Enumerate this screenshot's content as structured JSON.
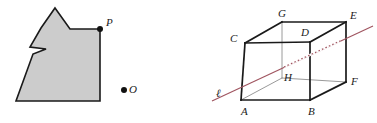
{
  "page": {
    "width": 377,
    "height": 123,
    "background": "#ffffff"
  },
  "colors": {
    "polygon_fill": "#cccccc",
    "polygon_stroke": "#1a1a1a",
    "cube_edge_visible": "#1a1a1a",
    "cube_edge_back": "#9a9a9a",
    "line_l": "#a05560",
    "point_fill": "#111111",
    "label": "#1a1a1a"
  },
  "figure_left": {
    "name": "shaded-polygon-with-points",
    "polygon": {
      "label": "shaded-polygon",
      "fill": "#cccccc",
      "stroke": "#1a1a1a",
      "stroke_width": 1.6,
      "vertices": [
        [
          55,
          8
        ],
        [
          70,
          29
        ],
        [
          100,
          29
        ],
        [
          100,
          101
        ],
        [
          16,
          101
        ],
        [
          33,
          54
        ],
        [
          46,
          49
        ],
        [
          30,
          47
        ],
        [
          41,
          28
        ]
      ]
    },
    "points": [
      {
        "name": "point-P",
        "label": "P",
        "x": 100,
        "y": 29,
        "label_x": 106,
        "label_y": 26,
        "radius": 3.0
      },
      {
        "name": "point-O",
        "label": "O",
        "x": 124,
        "y": 90,
        "label_x": 129,
        "label_y": 93,
        "radius": 3.0
      }
    ]
  },
  "figure_right": {
    "name": "cube-with-line-l",
    "cube": {
      "label": "cube-ABCDEFGH",
      "vertices": {
        "A": {
          "x": 53,
          "y": 100
        },
        "B": {
          "x": 122,
          "y": 100
        },
        "C": {
          "x": 57,
          "y": 43
        },
        "D": {
          "x": 122,
          "y": 42
        },
        "E": {
          "x": 158,
          "y": 22
        },
        "F": {
          "x": 158,
          "y": 82
        },
        "G": {
          "x": 94,
          "y": 22
        },
        "H": {
          "x": 94,
          "y": 78
        }
      },
      "visible_edges": [
        [
          "A",
          "B"
        ],
        [
          "A",
          "C"
        ],
        [
          "B",
          "D"
        ],
        [
          "C",
          "D"
        ],
        [
          "C",
          "G"
        ],
        [
          "G",
          "E"
        ],
        [
          "D",
          "E"
        ],
        [
          "E",
          "F"
        ],
        [
          "B",
          "F"
        ]
      ],
      "hidden_edges": [
        [
          "G",
          "H"
        ],
        [
          "H",
          "A"
        ],
        [
          "H",
          "F"
        ]
      ],
      "labels": [
        {
          "name": "vertex-label-A",
          "text": "A",
          "x": 53,
          "y": 115
        },
        {
          "name": "vertex-label-B",
          "text": "B",
          "x": 120,
          "y": 115
        },
        {
          "name": "vertex-label-C",
          "text": "C",
          "x": 42,
          "y": 42
        },
        {
          "name": "vertex-label-D",
          "text": "D",
          "x": 113,
          "y": 36
        },
        {
          "name": "vertex-label-E",
          "text": "E",
          "x": 162,
          "y": 19
        },
        {
          "name": "vertex-label-F",
          "text": "F",
          "x": 163,
          "y": 85
        },
        {
          "name": "vertex-label-G",
          "text": "G",
          "x": 90,
          "y": 17
        },
        {
          "name": "vertex-label-H",
          "text": "H",
          "x": 96,
          "y": 81
        }
      ]
    },
    "line": {
      "name": "line-l",
      "label": "ℓ",
      "label_x": 28,
      "label_y": 97,
      "color": "#a05560",
      "stroke_width": 1.2,
      "start": {
        "x": 24,
        "y": 101
      },
      "end": {
        "x": 185,
        "y": 26
      },
      "hidden_segment": {
        "start": {
          "x": 96,
          "y": 67
        },
        "end": {
          "x": 152,
          "y": 41
        }
      }
    }
  }
}
